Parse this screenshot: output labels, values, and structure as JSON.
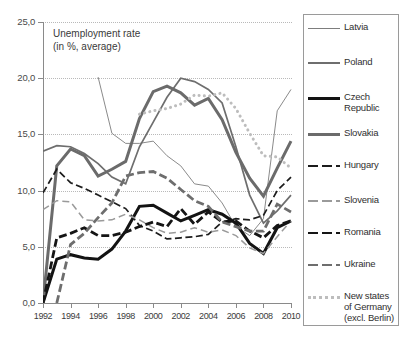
{
  "chart_data": {
    "type": "line",
    "title": "Unemployment rate\n(in %, average)",
    "xlabel": "",
    "ylabel": "",
    "xlim": [
      1992,
      2010
    ],
    "ylim": [
      0.0,
      25.0
    ],
    "ytick_labels": [
      "0,0",
      "5,0",
      "10,0",
      "15,0",
      "20,0",
      "25,0"
    ],
    "ytick_values": [
      0,
      5,
      10,
      15,
      20,
      25
    ],
    "xtick_labels": [
      "1992",
      "1994",
      "1996",
      "1998",
      "2000",
      "2002",
      "2004",
      "2006",
      "2008",
      "2010"
    ],
    "xtick_values": [
      1992,
      1994,
      1996,
      1998,
      2000,
      2002,
      2004,
      2006,
      2008,
      2010
    ],
    "grid": true,
    "legend_position": "right",
    "x": [
      1992,
      1993,
      1994,
      1995,
      1996,
      1997,
      1998,
      1999,
      2000,
      2001,
      2002,
      2003,
      2004,
      2005,
      2006,
      2007,
      2008,
      2009,
      2010
    ],
    "series": [
      {
        "name": "Latvia",
        "style": "solid-thin",
        "color": "#7d7d7d",
        "width": 0.9,
        "values": [
          null,
          null,
          null,
          null,
          20.1,
          15.1,
          14.2,
          14.2,
          14.4,
          13.1,
          12.2,
          10.6,
          10.4,
          8.9,
          6.8,
          6.0,
          7.5,
          17.1,
          19.0
        ]
      },
      {
        "name": "Poland",
        "style": "solid-medium",
        "color": "#6e6e6e",
        "width": 1.7,
        "values": [
          13.5,
          14.0,
          13.9,
          13.3,
          12.4,
          11.2,
          10.6,
          13.9,
          16.1,
          18.3,
          20.0,
          19.7,
          19.0,
          17.8,
          13.9,
          9.6,
          7.1,
          8.2,
          9.6
        ]
      },
      {
        "name": "Czech Republic",
        "style": "solid-thick-black",
        "color": "#131313",
        "width": 3.0,
        "values": [
          0.0,
          3.9,
          4.3,
          4.0,
          3.9,
          4.8,
          6.4,
          8.6,
          8.7,
          8.0,
          7.3,
          7.8,
          8.3,
          7.9,
          7.1,
          5.3,
          4.4,
          6.7,
          7.3
        ]
      },
      {
        "name": "Slovakia",
        "style": "solid-thick-gray",
        "color": "#6b6b6b",
        "width": 3.0,
        "values": [
          0.0,
          12.2,
          13.7,
          13.1,
          11.3,
          11.9,
          12.6,
          16.4,
          18.8,
          19.3,
          18.7,
          17.6,
          18.2,
          16.3,
          13.4,
          11.1,
          9.5,
          12.0,
          14.4
        ]
      },
      {
        "name": "Hungary",
        "style": "dashed-black",
        "color": "#1c1c1c",
        "width": 1.7,
        "values": [
          9.8,
          11.9,
          10.7,
          10.2,
          9.6,
          9.0,
          8.4,
          6.9,
          6.4,
          5.7,
          5.8,
          5.9,
          6.1,
          7.2,
          7.5,
          7.4,
          7.8,
          10.0,
          11.2
        ]
      },
      {
        "name": "Slovenia",
        "style": "dashed-gray",
        "color": "#9a9a9a",
        "width": 1.5,
        "values": [
          8.3,
          9.1,
          9.0,
          7.4,
          7.3,
          7.4,
          7.9,
          7.4,
          6.7,
          6.2,
          6.3,
          6.7,
          6.3,
          6.5,
          6.0,
          4.9,
          4.4,
          5.9,
          7.3
        ]
      },
      {
        "name": "Romania",
        "style": "dashed-thick-black",
        "color": "#151515",
        "width": 2.8,
        "values": [
          0.0,
          5.8,
          6.2,
          6.7,
          6.0,
          6.0,
          6.3,
          6.8,
          7.2,
          6.8,
          8.4,
          7.0,
          8.1,
          7.2,
          7.3,
          6.4,
          5.8,
          6.9,
          7.3
        ]
      },
      {
        "name": "Ukraine",
        "style": "dashed-thick-gray",
        "color": "#6e6e6e",
        "width": 2.8,
        "values": [
          null,
          0.0,
          5.2,
          6.2,
          7.6,
          8.9,
          11.3,
          11.6,
          11.7,
          11.1,
          10.1,
          9.1,
          8.6,
          7.2,
          6.8,
          6.4,
          6.4,
          8.8,
          8.1
        ]
      },
      {
        "name": "New states of Germany (excl. Berlin)",
        "style": "dotted",
        "color": "#bdbdbd",
        "width": 3.0,
        "values": [
          null,
          null,
          null,
          null,
          null,
          null,
          null,
          16.8,
          17.1,
          17.3,
          17.7,
          18.5,
          18.4,
          18.7,
          17.3,
          15.1,
          13.1,
          13.0,
          12.0
        ]
      }
    ]
  },
  "legend": {
    "items": [
      {
        "label": "Latvia",
        "swatch": "solid-thin"
      },
      {
        "label": "Poland",
        "swatch": "solid-medium"
      },
      {
        "label": "Czech\nRepublic",
        "swatch": "solid-thick-black"
      },
      {
        "label": "Slovakia",
        "swatch": "solid-thick-gray"
      },
      {
        "label": "Hungary",
        "swatch": "dashed-black"
      },
      {
        "label": "Slovenia",
        "swatch": "dashed-gray"
      },
      {
        "label": "Romania",
        "swatch": "dashed-thick-black"
      },
      {
        "label": "Ukraine",
        "swatch": "dashed-thick-gray"
      },
      {
        "label": "New states\nof Germany\n(excl. Berlin)",
        "swatch": "dotted"
      }
    ]
  },
  "colors": {
    "axis": "#8a8a8a",
    "grid": "#b9b9b9",
    "text": "#3a3a3a",
    "background": "#ffffff"
  }
}
